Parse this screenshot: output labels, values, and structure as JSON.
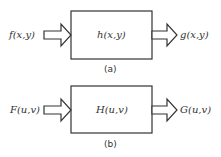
{
  "diagram_a": {
    "input": "f(x,y)",
    "system": "h(x,y)",
    "output": "g(x,y)",
    "caption": "(a)"
  },
  "diagram_b": {
    "input": "F(u,v)",
    "system": "H(u,v)",
    "output": "G(u,v)",
    "caption": "(b)"
  },
  "colors": {
    "stroke": "#333333",
    "background": "#ffffff"
  }
}
